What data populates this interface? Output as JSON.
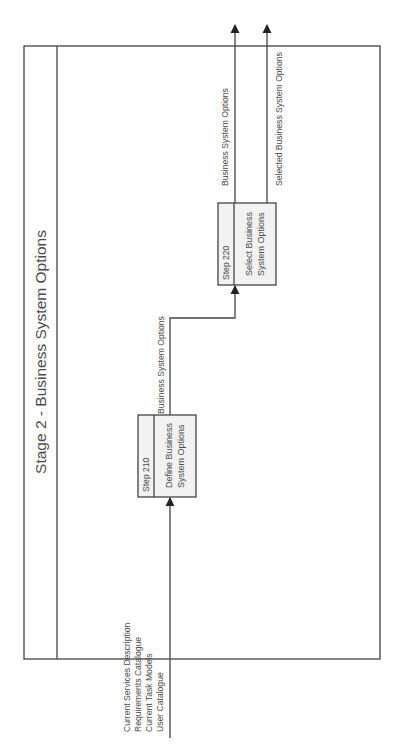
{
  "diagram": {
    "title": "Stage 2 - Business System Options",
    "steps": [
      {
        "id": "step-210",
        "number": "Step 210",
        "name_line1": "Define Business",
        "name_line2": "System Options"
      },
      {
        "id": "step-220",
        "number": "Step 220",
        "name_line1": "Select Business",
        "name_line2": "System Options"
      }
    ],
    "inputs": [
      "Current Services Description",
      "Requirements Catalogue",
      "Current Task Models",
      "User Catalogue"
    ],
    "flows": {
      "step210_to_step220": "Business System Options",
      "output_business": "Business System Options",
      "output_selected": "Selected Business System Options"
    },
    "colors": {
      "line": "#444444",
      "box_fill": "#f2f2f2",
      "text": "#4a4a4a"
    }
  }
}
